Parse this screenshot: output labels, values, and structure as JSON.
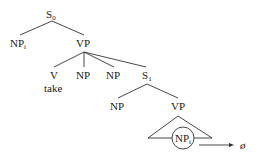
{
  "diagram": {
    "type": "syntax-tree",
    "nodes": {
      "s0": {
        "label": "S",
        "sub": "0"
      },
      "np_subject": {
        "label": "NP",
        "sub": "i"
      },
      "vp_main": {
        "label": "VP"
      },
      "v": {
        "label": "V",
        "word": "take"
      },
      "np_obj1": {
        "label": "NP"
      },
      "np_obj2": {
        "label": "NP"
      },
      "s_embedded": {
        "label": "S",
        "sub": "1"
      },
      "np_embedded": {
        "label": "NP"
      },
      "vp_embedded": {
        "label": "VP"
      },
      "np_gap": {
        "label": "NP",
        "sub": "i",
        "circled": true
      }
    },
    "arrow_target": "ø"
  }
}
